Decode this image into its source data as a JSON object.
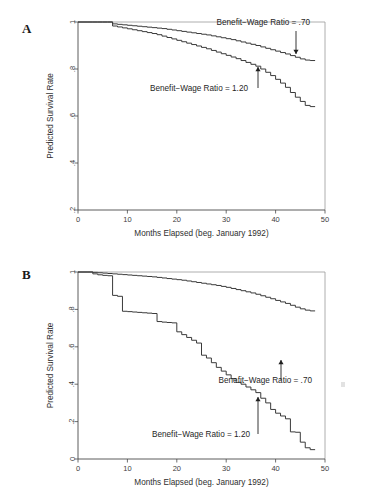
{
  "figure": {
    "panels": [
      {
        "letter": "A",
        "xlabel": "Months Elapsed (beg. January 1992)",
        "ylabel": "Predicted Survival Rate",
        "xticks": [
          "0",
          "10",
          "20",
          "30",
          "40",
          "50"
        ],
        "yticks": [
          ".2",
          ".4",
          ".6",
          ".8",
          "1"
        ],
        "annotations": [
          {
            "text": "Benefit−Wage Ratio = .70"
          },
          {
            "text": "Benefit−Wage Ratio = 1.20"
          }
        ]
      },
      {
        "letter": "B",
        "xlabel": "Months Elapsed (beg. January 1992)",
        "ylabel": "Predicted Survival Rate",
        "xticks": [
          "0",
          "10",
          "20",
          "30",
          "40",
          "50"
        ],
        "yticks": [
          "0",
          ".2",
          ".4",
          ".6",
          ".8",
          "1"
        ],
        "annotations": [
          {
            "text": "Benefit−Wage Ratio = .70"
          },
          {
            "text": "Benefit−Wage Ratio = 1.20"
          }
        ]
      }
    ]
  },
  "chart_data": [
    {
      "type": "line",
      "panel": "A",
      "title": "",
      "xlabel": "Months Elapsed (beg. January 1992)",
      "ylabel": "Predicted Survival Rate",
      "xlim": [
        0,
        50
      ],
      "ylim": [
        0.2,
        1.0
      ],
      "xticks": [
        0,
        10,
        20,
        30,
        40,
        50
      ],
      "yticks": [
        0.2,
        0.4,
        0.6,
        0.8,
        1.0
      ],
      "grid": false,
      "legend": "annotations-inline",
      "step": "post",
      "series": [
        {
          "name": "Benefit−Wage Ratio = .70",
          "x": [
            0,
            1,
            2,
            3,
            4,
            5,
            6,
            7,
            8,
            9,
            10,
            11,
            12,
            13,
            14,
            15,
            16,
            17,
            18,
            19,
            20,
            21,
            22,
            23,
            24,
            25,
            26,
            27,
            28,
            29,
            30,
            31,
            32,
            33,
            34,
            35,
            36,
            37,
            38,
            39,
            40,
            41,
            42,
            43,
            44,
            45,
            46,
            47,
            48
          ],
          "y": [
            1.0,
            1.0,
            1.0,
            1.0,
            1.0,
            1.0,
            1.0,
            0.992,
            0.99,
            0.988,
            0.986,
            0.984,
            0.982,
            0.98,
            0.978,
            0.976,
            0.974,
            0.972,
            0.969,
            0.966,
            0.963,
            0.96,
            0.957,
            0.954,
            0.951,
            0.948,
            0.945,
            0.941,
            0.937,
            0.933,
            0.929,
            0.925,
            0.92,
            0.915,
            0.91,
            0.905,
            0.9,
            0.894,
            0.888,
            0.882,
            0.876,
            0.87,
            0.864,
            0.857,
            0.85,
            0.843,
            0.838,
            0.836,
            0.836
          ]
        },
        {
          "name": "Benefit−Wage Ratio = 1.20",
          "x": [
            0,
            1,
            2,
            3,
            4,
            5,
            6,
            7,
            8,
            9,
            10,
            11,
            12,
            13,
            14,
            15,
            16,
            17,
            18,
            19,
            20,
            21,
            22,
            23,
            24,
            25,
            26,
            27,
            28,
            29,
            30,
            31,
            32,
            33,
            34,
            35,
            36,
            37,
            38,
            39,
            40,
            41,
            42,
            43,
            44,
            45,
            46,
            47,
            48
          ],
          "y": [
            1.0,
            1.0,
            1.0,
            1.0,
            1.0,
            1.0,
            1.0,
            0.983,
            0.979,
            0.975,
            0.971,
            0.967,
            0.963,
            0.959,
            0.955,
            0.951,
            0.946,
            0.94,
            0.934,
            0.928,
            0.922,
            0.916,
            0.91,
            0.904,
            0.898,
            0.892,
            0.886,
            0.879,
            0.872,
            0.865,
            0.858,
            0.851,
            0.844,
            0.836,
            0.828,
            0.82,
            0.812,
            0.8,
            0.786,
            0.772,
            0.756,
            0.74,
            0.722,
            0.7,
            0.68,
            0.662,
            0.645,
            0.64,
            0.64
          ]
        }
      ]
    },
    {
      "type": "line",
      "panel": "B",
      "title": "",
      "xlabel": "Months Elapsed (beg. January 1992)",
      "ylabel": "Predicted Survival Rate",
      "xlim": [
        0,
        50
      ],
      "ylim": [
        0.0,
        1.0
      ],
      "xticks": [
        0,
        10,
        20,
        30,
        40,
        50
      ],
      "yticks": [
        0.0,
        0.2,
        0.4,
        0.6,
        0.8,
        1.0
      ],
      "grid": false,
      "legend": "annotations-inline",
      "step": "post",
      "series": [
        {
          "name": "Benefit−Wage Ratio = .70",
          "x": [
            0,
            1,
            2,
            3,
            4,
            5,
            6,
            7,
            8,
            9,
            10,
            11,
            12,
            13,
            14,
            15,
            16,
            17,
            18,
            19,
            20,
            21,
            22,
            23,
            24,
            25,
            26,
            27,
            28,
            29,
            30,
            31,
            32,
            33,
            34,
            35,
            36,
            37,
            38,
            39,
            40,
            41,
            42,
            43,
            44,
            45,
            46,
            47,
            48
          ],
          "y": [
            1.0,
            1.0,
            1.0,
            0.998,
            0.996,
            0.994,
            0.992,
            0.99,
            0.988,
            0.986,
            0.984,
            0.982,
            0.98,
            0.978,
            0.976,
            0.974,
            0.971,
            0.968,
            0.965,
            0.962,
            0.959,
            0.956,
            0.952,
            0.948,
            0.944,
            0.94,
            0.936,
            0.932,
            0.928,
            0.923,
            0.918,
            0.912,
            0.906,
            0.9,
            0.894,
            0.888,
            0.881,
            0.873,
            0.865,
            0.857,
            0.848,
            0.84,
            0.832,
            0.822,
            0.812,
            0.803,
            0.796,
            0.792,
            0.792
          ]
        },
        {
          "name": "Benefit−Wage Ratio = 1.20",
          "x": [
            0,
            1,
            2,
            3,
            4,
            5,
            6,
            7,
            8,
            9,
            10,
            11,
            12,
            13,
            14,
            15,
            16,
            17,
            18,
            19,
            20,
            21,
            22,
            23,
            24,
            25,
            26,
            27,
            28,
            29,
            30,
            31,
            32,
            33,
            34,
            35,
            36,
            37,
            38,
            39,
            40,
            41,
            42,
            43,
            44,
            45,
            46,
            47,
            48
          ],
          "y": [
            1.0,
            1.0,
            1.0,
            0.99,
            0.985,
            0.982,
            0.98,
            0.875,
            0.87,
            0.79,
            0.788,
            0.786,
            0.784,
            0.782,
            0.78,
            0.778,
            0.735,
            0.732,
            0.73,
            0.728,
            0.68,
            0.665,
            0.65,
            0.635,
            0.62,
            0.555,
            0.54,
            0.515,
            0.49,
            0.47,
            0.45,
            0.43,
            0.41,
            0.4,
            0.385,
            0.37,
            0.355,
            0.325,
            0.3,
            0.265,
            0.245,
            0.23,
            0.215,
            0.145,
            0.143,
            0.09,
            0.06,
            0.05,
            0.05
          ]
        }
      ]
    }
  ]
}
